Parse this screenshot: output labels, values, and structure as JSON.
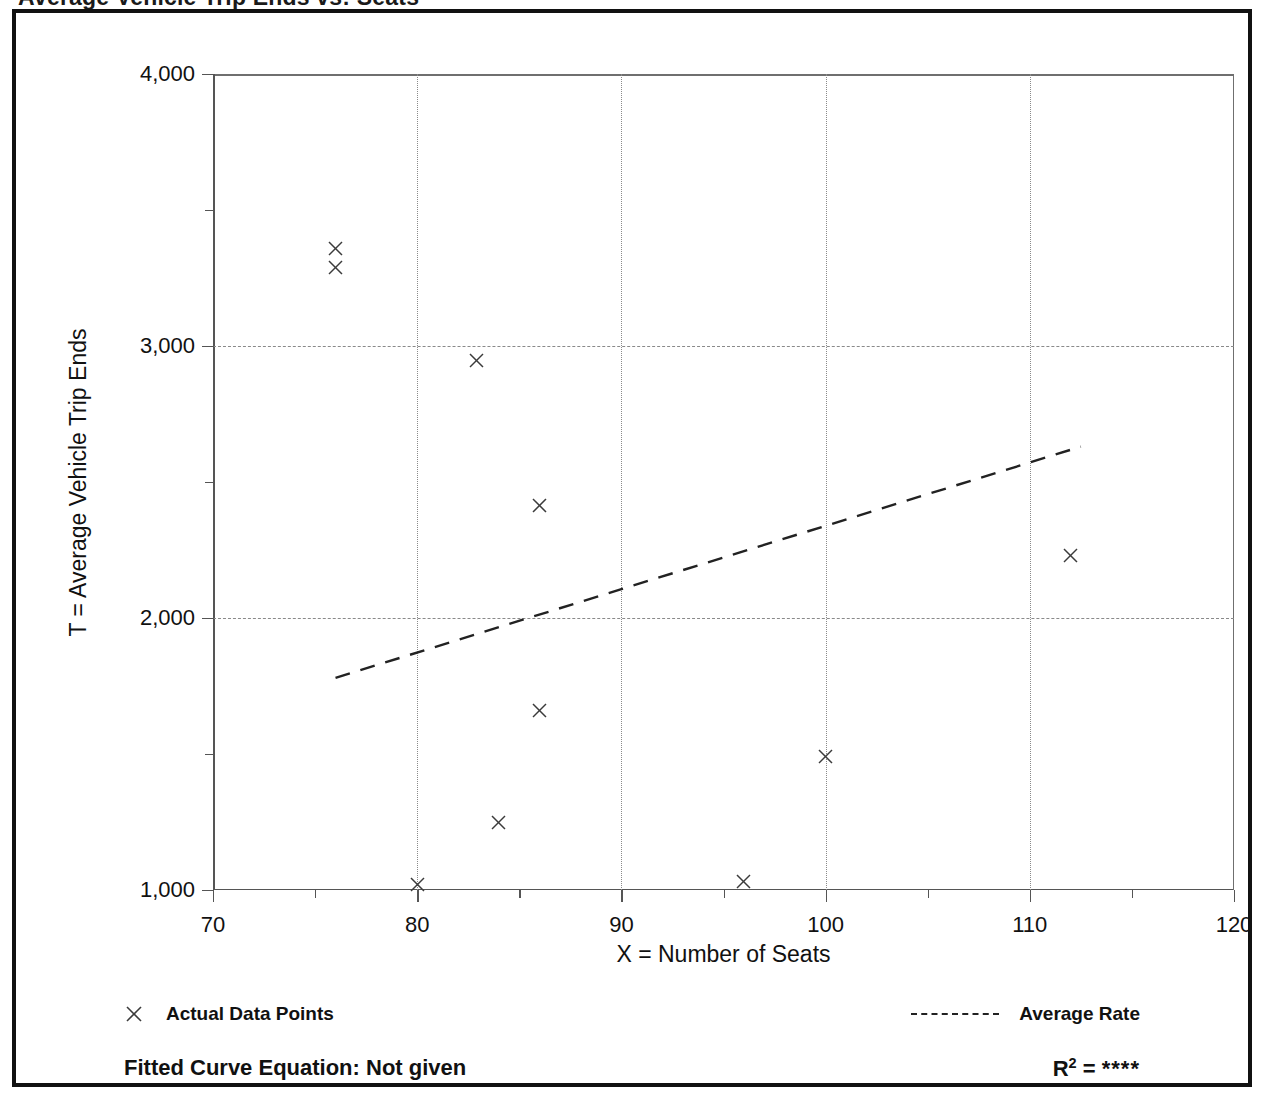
{
  "page": {
    "clipped_header": "Average Vehicle Trip Ends vs: Seats"
  },
  "legend": {
    "data_points_label": "Actual Data Points",
    "average_rate_label": "Average Rate",
    "data_points_marker": "x-cross-marker",
    "average_rate_marker": "dashed-line-swatch"
  },
  "footer": {
    "fitted_curve_label": "Fitted Curve Equation:  Not given",
    "r_squared_prefix": "R",
    "r_squared_exponent": "2",
    "r_squared_equals": " = ",
    "r_squared_value": "****"
  },
  "chart_data": {
    "type": "scatter",
    "title": "",
    "xlabel": "X = Number of Seats",
    "ylabel": "T = Average Vehicle Trip Ends",
    "xlim": [
      70,
      120
    ],
    "ylim": [
      1000,
      4000
    ],
    "xticks": [
      70,
      80,
      90,
      100,
      110,
      120
    ],
    "xtick_labels": [
      "70",
      "80",
      "90",
      "100",
      "110",
      "120"
    ],
    "xminor_ticks": [
      75,
      85,
      95,
      105,
      115
    ],
    "yticks": [
      1000,
      2000,
      3000,
      4000
    ],
    "ytick_labels": [
      "1,000",
      "2,000",
      "3,000",
      "4,000"
    ],
    "yminor_ticks": [
      1500,
      2500,
      3500
    ],
    "grid": "dashed gridlines at y = 2000 and y = 3000; dotted vertical gridlines at x = 80, 90, 100, 110",
    "legend_position": "below-axes",
    "series": [
      {
        "name": "Actual Data Points",
        "type": "scatter",
        "marker": "x",
        "points": [
          {
            "x": 76,
            "y": 3360
          },
          {
            "x": 76,
            "y": 3290
          },
          {
            "x": 82.9,
            "y": 2945
          },
          {
            "x": 86,
            "y": 2415
          },
          {
            "x": 86,
            "y": 1660
          },
          {
            "x": 112,
            "y": 2230
          },
          {
            "x": 100,
            "y": 1490
          },
          {
            "x": 84,
            "y": 1250
          },
          {
            "x": 80,
            "y": 1020
          },
          {
            "x": 96,
            "y": 1030
          }
        ]
      },
      {
        "name": "Average Rate",
        "type": "line",
        "style": "dashed",
        "x": [
          76,
          112.5
        ],
        "y": [
          1780,
          2630
        ]
      }
    ]
  }
}
